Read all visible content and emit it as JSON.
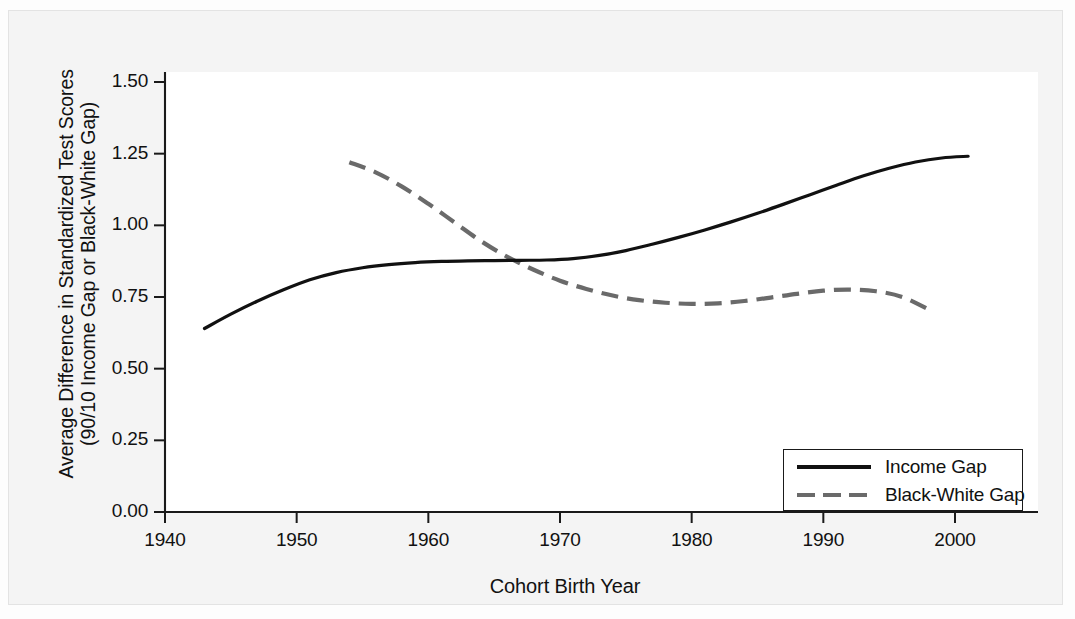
{
  "chart_data": {
    "type": "line",
    "title": "",
    "xlabel": "Cohort Birth Year",
    "ylabel_line1": "Average Difference in Standardized Test Scores",
    "ylabel_line2": "(90/10 Income Gap or Black-White Gap)",
    "xlim": [
      1938,
      2006
    ],
    "ylim": [
      0.0,
      1.5
    ],
    "xticks": [
      1940,
      1950,
      1960,
      1970,
      1980,
      1990,
      2000
    ],
    "xtick_labels": [
      "1940",
      "1950",
      "1960",
      "1970",
      "1980",
      "1990",
      "2000"
    ],
    "yticks": [
      0.0,
      0.25,
      0.5,
      0.75,
      1.0,
      1.25,
      1.5
    ],
    "ytick_labels": [
      "0.00",
      "0.25",
      "0.50",
      "0.75",
      "1.00",
      "1.25",
      "1.50"
    ],
    "grid": false,
    "legend_position": "lower right",
    "series": [
      {
        "name": "Income Gap",
        "style": "solid",
        "color": "#111111",
        "x": [
          1943,
          1945,
          1947,
          1949,
          1951,
          1953,
          1955,
          1957,
          1959,
          1961,
          1963,
          1965,
          1967,
          1969,
          1971,
          1973,
          1975,
          1977,
          1979,
          1981,
          1983,
          1985,
          1987,
          1989,
          1991,
          1993,
          1995,
          1997,
          1999,
          2001
        ],
        "values": [
          0.64,
          0.69,
          0.735,
          0.775,
          0.81,
          0.835,
          0.852,
          0.863,
          0.87,
          0.874,
          0.876,
          0.877,
          0.878,
          0.879,
          0.884,
          0.895,
          0.912,
          0.934,
          0.958,
          0.984,
          1.012,
          1.042,
          1.074,
          1.107,
          1.14,
          1.172,
          1.199,
          1.221,
          1.235,
          1.241
        ]
      },
      {
        "name": "Black-White Gap",
        "style": "dashed",
        "color": "#6a6a6a",
        "x": [
          1954,
          1956,
          1958,
          1960,
          1962,
          1964,
          1966,
          1968,
          1970,
          1972,
          1974,
          1976,
          1978,
          1980,
          1982,
          1984,
          1986,
          1988,
          1990,
          1992,
          1994,
          1996,
          1998
        ],
        "values": [
          1.22,
          1.185,
          1.135,
          1.075,
          1.01,
          0.945,
          0.89,
          0.845,
          0.807,
          0.778,
          0.755,
          0.739,
          0.73,
          0.726,
          0.728,
          0.736,
          0.748,
          0.761,
          0.772,
          0.776,
          0.77,
          0.75,
          0.707
        ]
      }
    ],
    "legend": [
      {
        "label": "Income Gap",
        "style": "solid"
      },
      {
        "label": "Black-White Gap",
        "style": "dashed"
      }
    ]
  }
}
